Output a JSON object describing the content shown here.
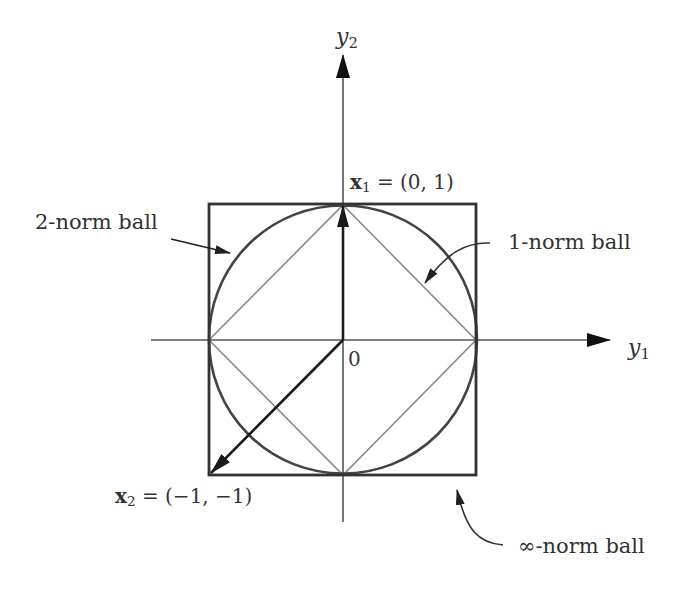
{
  "figure": {
    "axes": {
      "x_label": {
        "var": "y",
        "sub": "1"
      },
      "y_label": {
        "var": "y",
        "sub": "2"
      },
      "origin_label": "0"
    },
    "points": [
      {
        "name": "x1",
        "var": "x",
        "sub": "1",
        "eq": "= (0, 1)",
        "coords": [
          0,
          1
        ]
      },
      {
        "name": "x2",
        "var": "x",
        "sub": "2",
        "eq": "= (−1, −1)",
        "coords": [
          -1,
          -1
        ]
      }
    ],
    "annotations": {
      "two_norm": "2-norm ball",
      "one_norm": "1-norm ball",
      "inf_norm": "∞-norm ball"
    },
    "colors": {
      "axis": "#555555",
      "square": "#333333",
      "circle": "#444444",
      "diamond": "#888888",
      "vector": "#222222",
      "text": "#333333"
    }
  }
}
